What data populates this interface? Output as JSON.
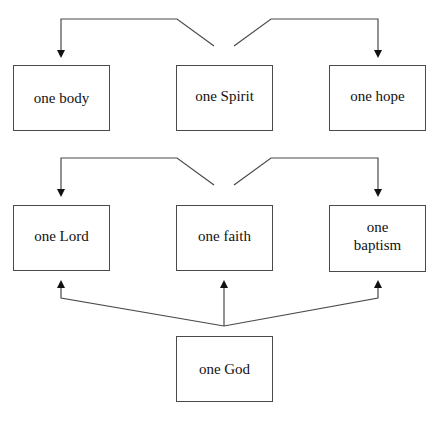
{
  "diagram": {
    "type": "relationship-diagram",
    "rows": [
      {
        "source": "one Spirit",
        "nodes": [
          {
            "id": "body",
            "label": "one body"
          },
          {
            "id": "spirit",
            "label": "one Spirit"
          },
          {
            "id": "hope",
            "label": "one hope"
          }
        ]
      },
      {
        "source": "one faith",
        "nodes": [
          {
            "id": "lord",
            "label": "one Lord"
          },
          {
            "id": "faith",
            "label": "one faith"
          },
          {
            "id": "baptism",
            "label": "one baptism"
          }
        ]
      },
      {
        "nodes": [
          {
            "id": "god",
            "label": "one God"
          }
        ]
      }
    ],
    "edges": [
      {
        "from": "one Spirit",
        "to": "one body"
      },
      {
        "from": "one Spirit",
        "to": "one hope"
      },
      {
        "from": "one faith",
        "to": "one Lord"
      },
      {
        "from": "one faith",
        "to": "one baptism"
      },
      {
        "from": "one God",
        "to": "one Lord"
      },
      {
        "from": "one God",
        "to": "one faith"
      },
      {
        "from": "one God",
        "to": "one baptism"
      }
    ]
  },
  "colors": {
    "line": "#4a4a4a",
    "background": "#ffffff"
  }
}
